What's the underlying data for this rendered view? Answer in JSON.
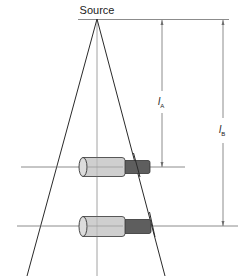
{
  "diagram": {
    "source_label": "Source",
    "dimension_a": {
      "symbol": "l",
      "subscript": "A"
    },
    "dimension_b": {
      "symbol": "l",
      "subscript": "B"
    },
    "objects": [
      {
        "name": "object-a",
        "position": "near"
      },
      {
        "name": "object-b",
        "position": "far"
      }
    ],
    "colors": {
      "line": "#2a2a2a",
      "thin_line": "#6e6e6e",
      "cylinder_light": "#cfcfcf",
      "cylinder_dark": "#5e5e5e",
      "outline": "#333333"
    }
  }
}
